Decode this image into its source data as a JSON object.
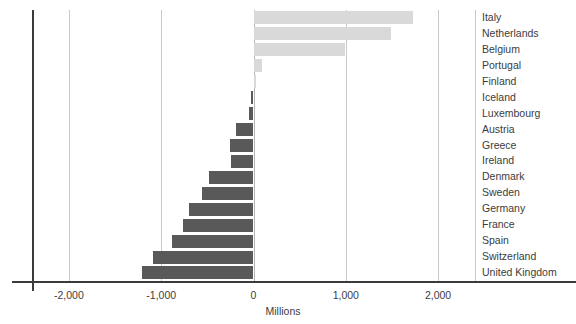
{
  "chart_data": {
    "type": "bar",
    "orientation": "horizontal",
    "title": "",
    "xlabel": "Millions",
    "ylabel": "",
    "xlim": [
      -2400,
      2400
    ],
    "xticks": [
      -2000,
      -1000,
      0,
      1000,
      2000
    ],
    "xticklabels": [
      "-2,000",
      "-1,000",
      "0",
      "1,000",
      "2,000"
    ],
    "grid": "vertical",
    "legend": "none",
    "categories": [
      "Italy",
      "Netherlands",
      "Belgium",
      "Portugal",
      "Finland",
      "Iceland",
      "Luxembourg",
      "Austria",
      "Greece",
      "Ireland",
      "Denmark",
      "Sweden",
      "Germany",
      "France",
      "Spain",
      "Switzerland",
      "United Kingdom"
    ],
    "values": [
      1730,
      1485,
      990,
      90,
      25,
      -30,
      -45,
      -190,
      -250,
      -240,
      -480,
      -555,
      -700,
      -760,
      -880,
      -1090,
      -1210
    ],
    "colors": {
      "positive": "#d9d9d9",
      "negative": "#595959",
      "gridline": "#c9c9c9",
      "axis": "#3b3b3b",
      "text": "#3c3c3c"
    }
  }
}
